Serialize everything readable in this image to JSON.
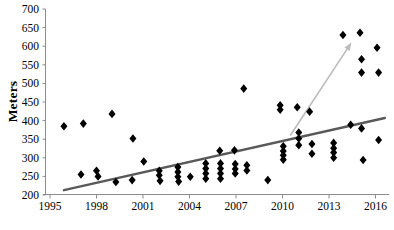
{
  "figure": {
    "width": 394,
    "height": 230,
    "background": "#ffffff"
  },
  "chart_data": {
    "type": "scatter",
    "title": "",
    "xlabel": "",
    "ylabel": "Meters",
    "xlim": [
      1995,
      2017
    ],
    "ylim": [
      200,
      700
    ],
    "x_ticks": [
      1995,
      1998,
      2001,
      2004,
      2007,
      2010,
      2013,
      2016
    ],
    "y_ticks": [
      200,
      250,
      300,
      350,
      400,
      450,
      500,
      550,
      600,
      650,
      700
    ],
    "grid": false,
    "legend": "none",
    "axis_color": "#8c8c8c",
    "marker": {
      "shape": "diamond",
      "color": "#000000",
      "width": 7,
      "height": 8.6
    },
    "points": [
      [
        1995.9,
        385
      ],
      [
        1997.0,
        255
      ],
      [
        1997.15,
        392
      ],
      [
        1998.0,
        265
      ],
      [
        1998.1,
        250
      ],
      [
        1999.0,
        418
      ],
      [
        1999.25,
        235
      ],
      [
        2000.3,
        240
      ],
      [
        2000.35,
        352
      ],
      [
        2001.05,
        290
      ],
      [
        2002.05,
        265
      ],
      [
        2002.05,
        253
      ],
      [
        2002.1,
        238
      ],
      [
        2003.25,
        275
      ],
      [
        2003.25,
        262
      ],
      [
        2003.25,
        249
      ],
      [
        2003.3,
        236
      ],
      [
        2004.05,
        249
      ],
      [
        2005.05,
        285
      ],
      [
        2005.05,
        271
      ],
      [
        2005.05,
        258
      ],
      [
        2005.05,
        244
      ],
      [
        2005.95,
        319
      ],
      [
        2006.0,
        285
      ],
      [
        2006.0,
        271
      ],
      [
        2006.0,
        258
      ],
      [
        2006.0,
        244
      ],
      [
        2006.9,
        320
      ],
      [
        2006.95,
        283
      ],
      [
        2006.95,
        270
      ],
      [
        2006.95,
        258
      ],
      [
        2007.5,
        486
      ],
      [
        2007.7,
        280
      ],
      [
        2007.7,
        266
      ],
      [
        2009.05,
        240
      ],
      [
        2009.85,
        441
      ],
      [
        2009.85,
        429
      ],
      [
        2010.05,
        331
      ],
      [
        2010.05,
        318
      ],
      [
        2010.05,
        307
      ],
      [
        2010.05,
        295
      ],
      [
        2010.95,
        436
      ],
      [
        2011.05,
        368
      ],
      [
        2011.05,
        352
      ],
      [
        2011.05,
        334
      ],
      [
        2011.75,
        424
      ],
      [
        2011.9,
        337
      ],
      [
        2011.9,
        311
      ],
      [
        2013.3,
        340
      ],
      [
        2013.3,
        326
      ],
      [
        2013.3,
        314
      ],
      [
        2013.3,
        300
      ],
      [
        2013.9,
        630
      ],
      [
        2014.4,
        389
      ],
      [
        2015.0,
        636
      ],
      [
        2015.1,
        565
      ],
      [
        2015.1,
        529
      ],
      [
        2015.1,
        379
      ],
      [
        2015.2,
        294
      ],
      [
        2016.1,
        596
      ],
      [
        2016.2,
        529
      ],
      [
        2016.2,
        348
      ]
    ],
    "trend_line": {
      "name": "linear-trend",
      "color": "#595959",
      "width": 2.4,
      "from": [
        1995.9,
        213
      ],
      "to": [
        2016.6,
        407
      ]
    },
    "arrow_line": {
      "name": "steep-rise-arrow",
      "color": "#bcbcbc",
      "width": 1.6,
      "from": [
        2010.5,
        360
      ],
      "to": [
        2014.45,
        610
      ],
      "arrowhead": true
    }
  }
}
